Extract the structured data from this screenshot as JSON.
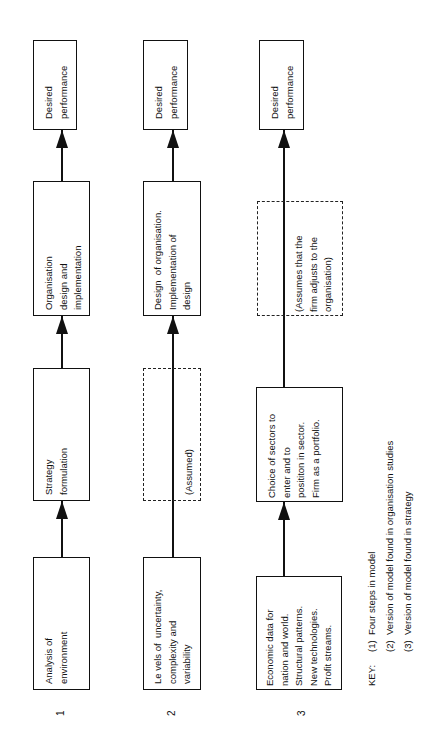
{
  "diagram": {
    "orientation": "rotated-90-ccw",
    "columns": [
      {
        "number": "1",
        "steps": [
          {
            "label": "Analysis of\nenvironment",
            "style": "solid"
          },
          {
            "label": "Strategy\nformulation",
            "style": "solid"
          },
          {
            "label": "Organisation\ndesign and\nimplementation",
            "style": "solid"
          },
          {
            "label": "Desired\nperformance",
            "style": "solid"
          }
        ]
      },
      {
        "number": "2",
        "steps": [
          {
            "label": "Le vels of  uncertainty,\ncomplexity and\nvariability",
            "style": "solid"
          },
          {
            "label": "(Assumed)",
            "style": "dashed"
          },
          {
            "label": "Design  of organisation.\nImplementation of\ndesign",
            "style": "solid"
          },
          {
            "label": "Desired\nperformance",
            "style": "solid"
          }
        ]
      },
      {
        "number": "3",
        "steps": [
          {
            "label": "Economic data for\nnation and world.\nStructural patterns.\nNew technologies.\nProfit streams.",
            "style": "solid"
          },
          {
            "label": "Choice of sectors to\nenter and to\nposititon in sector.\nFirm as a portfolio.",
            "style": "solid"
          },
          {
            "label": "(Assumes that the\nfirm adjusts to the\norganisation)",
            "style": "dashed"
          },
          {
            "label": "Desired\nperformance",
            "style": "solid"
          }
        ]
      }
    ],
    "key": {
      "title": "KEY:",
      "items": [
        "(1)  Four steps in model",
        "(2)  Version of model found in organisation studies",
        "(3)  Version of model found in strategy"
      ]
    }
  }
}
